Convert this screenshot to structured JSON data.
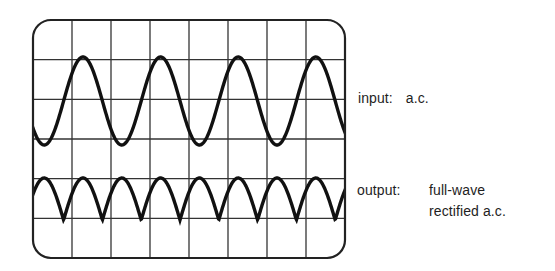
{
  "diagram": {
    "colors": {
      "background": "#ffffff",
      "frame": "#222222",
      "grid": "#333333",
      "trace": "#111111",
      "text": "#1e1e1e"
    },
    "screen": {
      "x": 33,
      "y": 20,
      "width": 312,
      "height": 238,
      "corner_radius": 18,
      "columns": 8,
      "rows": 6
    },
    "traces": [
      {
        "id": "input",
        "type": "sine",
        "center_y": 101,
        "amplitude": 44,
        "period": 77.6,
        "first_peak_x": 83,
        "stroke_width": 3.4
      },
      {
        "id": "output",
        "type": "full-wave-rectified",
        "baseline_y": 220,
        "amplitude": 42,
        "period": 77.6,
        "first_peak_x": 83,
        "stroke_width": 3.4
      }
    ]
  },
  "labels": {
    "input": {
      "key": "input:",
      "value": "a.c."
    },
    "output": {
      "key": "output:",
      "value_line1": "full-wave",
      "value_line2": "rectified a.c."
    }
  }
}
